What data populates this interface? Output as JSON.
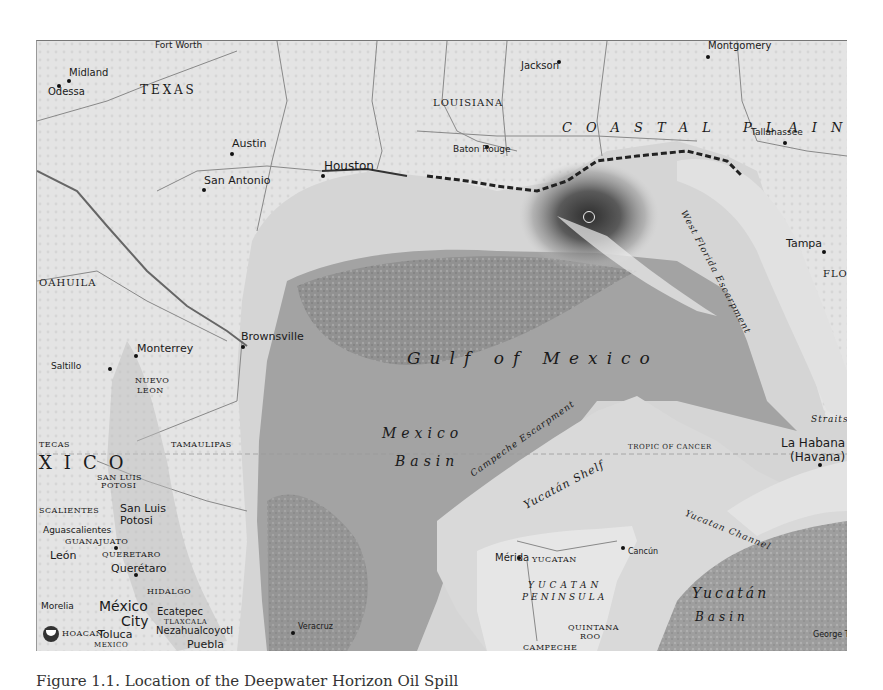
{
  "caption": "Figure 1.1. Location of the Deepwater Horizon Oil Spill",
  "map": {
    "title": "Gulf of Mexico",
    "logo": "noaa-logo",
    "colors": {
      "land": "#e6e6e6",
      "shelf": "#d4d4d4",
      "deep_water": "#9e9e9e",
      "slope": "#b3b3b3",
      "oil_slick": "#3a3a3a",
      "text": "#1a1a1a"
    },
    "labels": {
      "states": {
        "texas": "TEXAS",
        "louisiana": "LOUISIANA",
        "coahuila": "OAHUILA",
        "nuevo_leon_1": "NUEVO",
        "nuevo_leon_2": "LEON",
        "tamaulipas": "TAMAULIPAS",
        "zacatecas": "TECAS",
        "san_luis_potosi_1": "SAN LUIS",
        "san_luis_potosi_2": "POTOSI",
        "aguascalientes": "SCALIENTES",
        "guanajuato": "GUANAJUATO",
        "queretaro": "QUERETARO",
        "hidalgo": "HIDALGO",
        "michoacan": "HOACAN",
        "tlaxcala": "TLAXCALA",
        "mexico_state": "MEXICO",
        "yucatan": "YUCATAN",
        "quintana_roo_1": "QUINTANA",
        "quintana_roo_2": "ROO",
        "campeche": "CAMPECHE",
        "florida": "FLO"
      },
      "cities": {
        "fort_worth": "Fort Worth",
        "midland": "Midland",
        "odessa": "Odessa",
        "austin": "Austin",
        "san_antonio": "San Antonio",
        "houston": "Houston",
        "jackson": "Jackson",
        "baton_rouge": "Baton Rouge",
        "montgomery": "Montgomery",
        "tallahassee": "Tallahassee",
        "tampa": "Tampa",
        "brownsville": "Brownsville",
        "monterrey": "Monterrey",
        "saltillo": "Saltillo",
        "san_luis_potosi_1": "San Luis",
        "san_luis_potosi_2": "Potosi",
        "aguascalientes": "Aguascalientes",
        "leon": "León",
        "queretaro": "Querétaro",
        "morelia": "Morelia",
        "mexico_city_1": "México",
        "mexico_city_2": "City",
        "ecatepec": "Ecatepec",
        "toluca": "Toluca",
        "nezahualcoyotl": "Nezahualcoyotl",
        "puebla": "Puebla",
        "veracruz": "Veracruz",
        "merida": "Mérida",
        "cancun": "Cancún",
        "la_habana_1": "La Habana",
        "la_habana_2": "(Havana)",
        "george_town": "George Tow"
      },
      "regions": {
        "coastal_plain": "COASTAL PLAIN",
        "mexico_country": "XICO",
        "yucatan_peninsula_1": "YUCATAN",
        "yucatan_peninsula_2": "PENINSULA"
      },
      "water": {
        "gulf": "Gulf of Mexico",
        "mexico_basin_1": "Mexico",
        "mexico_basin_2": "Basin",
        "yucatan_basin_1": "Yucatán",
        "yucatan_basin_2": "Basin",
        "straits": "Straits",
        "yucatan_channel": "Yucatan Channel"
      },
      "features": {
        "west_florida_escarpment": "West Florida Escarpment",
        "campeche_escarpment": "Campeche Escarpment",
        "yucatan_shelf": "Yucatán Shelf",
        "tropic_of_cancer": "TROPIC OF CANCER"
      }
    },
    "spill_site": {
      "label": "deepwater-horizon-wellhead"
    }
  }
}
